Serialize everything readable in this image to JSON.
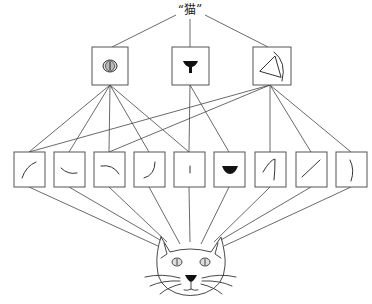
{
  "concept_label": "“猫”",
  "levels": {
    "top_concept": "猫",
    "mid_features": [
      {
        "id": "eye",
        "icon": "eye-icon"
      },
      {
        "id": "nose",
        "icon": "nose-icon"
      },
      {
        "id": "ear",
        "icon": "ear-icon"
      }
    ],
    "low_features": [
      {
        "id": "curve-up-right",
        "icon": "curve-up-right-icon"
      },
      {
        "id": "curve-down-right",
        "icon": "curve-down-right-icon"
      },
      {
        "id": "curve-right-down",
        "icon": "curve-right-down-icon"
      },
      {
        "id": "curve-j",
        "icon": "curve-j-icon"
      },
      {
        "id": "short-vertical",
        "icon": "short-vertical-icon"
      },
      {
        "id": "black-blob",
        "icon": "black-blob-icon"
      },
      {
        "id": "hook-stroke",
        "icon": "hook-stroke-icon"
      },
      {
        "id": "diagonal-stroke",
        "icon": "diagonal-stroke-icon"
      },
      {
        "id": "right-arc",
        "icon": "right-arc-icon"
      }
    ],
    "input_image": "cat-face"
  },
  "connections": {
    "mid_to_low": {
      "eye": [
        1,
        2,
        3,
        4,
        5
      ],
      "nose": [
        5,
        6
      ],
      "ear": [
        1,
        3,
        7,
        8,
        9
      ]
    },
    "low_to_input": [
      1,
      2,
      3,
      4,
      5,
      6,
      7,
      8,
      9
    ]
  },
  "colors": {
    "line": "#444444",
    "box_border": "#555555",
    "background": "#ffffff"
  }
}
